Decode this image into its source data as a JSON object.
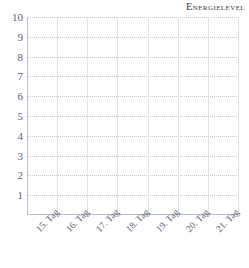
{
  "chart_data": {
    "type": "line",
    "title": "Energielevel",
    "xlabel": "",
    "ylabel": "",
    "categories": [
      "15. Tag",
      "16. Tag",
      "17. Tag",
      "18. Tag",
      "19. Tag",
      "20. Tag",
      "21. Tag"
    ],
    "series": [
      {
        "name": "Energielevel",
        "values": [
          null,
          null,
          null,
          null,
          null,
          null,
          null
        ]
      }
    ],
    "y_ticks": [
      1,
      2,
      3,
      4,
      5,
      6,
      7,
      8,
      9,
      10
    ],
    "ylim": [
      0,
      10
    ],
    "grid": true,
    "grid_horizontal_style": "dotted",
    "grid_vertical_style": "solid",
    "legend": false,
    "legend_position": "none",
    "note": "Empty tracking grid; no data plotted."
  },
  "colors": {
    "background": "#ffffff",
    "title": "#3b3b44",
    "axis_line": "#b9bfcd",
    "grid_horizontal": "#c3c9d6",
    "grid_vertical": "#dfe3eb",
    "tick_label": "#5d6470"
  }
}
